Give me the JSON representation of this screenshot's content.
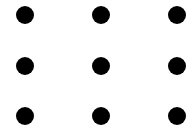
{
  "diagram": {
    "type": "dot-grid",
    "rows": 3,
    "cols": 3,
    "dot_color": "#000000",
    "background": "#ffffff",
    "dots": [
      {
        "row": 0,
        "col": 0,
        "x": 25,
        "y": 15
      },
      {
        "row": 0,
        "col": 1,
        "x": 101,
        "y": 15
      },
      {
        "row": 0,
        "col": 2,
        "x": 177,
        "y": 15
      },
      {
        "row": 1,
        "col": 0,
        "x": 25,
        "y": 66
      },
      {
        "row": 1,
        "col": 1,
        "x": 101,
        "y": 66
      },
      {
        "row": 1,
        "col": 2,
        "x": 177,
        "y": 66
      },
      {
        "row": 2,
        "col": 0,
        "x": 25,
        "y": 116
      },
      {
        "row": 2,
        "col": 1,
        "x": 101,
        "y": 116
      },
      {
        "row": 2,
        "col": 2,
        "x": 177,
        "y": 116
      }
    ]
  }
}
